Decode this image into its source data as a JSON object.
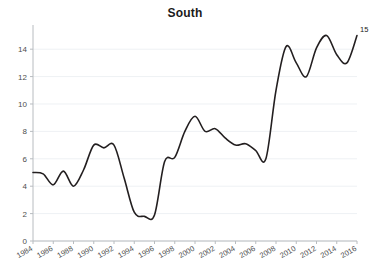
{
  "chart_data": {
    "type": "line",
    "title": "South",
    "xlabel": "",
    "ylabel": "",
    "xlim": [
      1984,
      2016
    ],
    "ylim": [
      0,
      15.4
    ],
    "grid": true,
    "legend": false,
    "x_tick_labels": [
      "1984",
      "1986",
      "1988",
      "1990",
      "1992",
      "1994",
      "1996",
      "1998",
      "2000",
      "2002",
      "2004",
      "2006",
      "2008",
      "2010",
      "2012",
      "2014",
      "2016"
    ],
    "y_tick_labels": [
      "0",
      "2",
      "4",
      "6",
      "8",
      "10",
      "12",
      "14"
    ],
    "y_ticks": [
      0,
      2,
      4,
      6,
      8,
      10,
      12,
      14
    ],
    "line_color": "#231f20",
    "grid_color": "#eef1f4",
    "axis_color": "#b8bcc0",
    "endpoint_annotation": "15",
    "x": [
      1984,
      1985,
      1986,
      1987,
      1988,
      1989,
      1990,
      1991,
      1992,
      1993,
      1994,
      1995,
      1996,
      1997,
      1998,
      1999,
      2000,
      2001,
      2002,
      2003,
      2004,
      2005,
      2006,
      2007,
      2008,
      2009,
      2010,
      2011,
      2012,
      2013,
      2014,
      2015,
      2016
    ],
    "values": [
      5.0,
      4.9,
      4.1,
      5.1,
      4.0,
      5.2,
      7.0,
      6.8,
      7.0,
      4.6,
      2.1,
      1.8,
      1.9,
      5.8,
      6.1,
      8.0,
      9.1,
      8.0,
      8.2,
      7.5,
      7.0,
      7.1,
      6.6,
      6.0,
      11.0,
      14.2,
      13.0,
      12.0,
      14.1,
      15.0,
      13.6,
      13.0,
      15.0
    ]
  }
}
